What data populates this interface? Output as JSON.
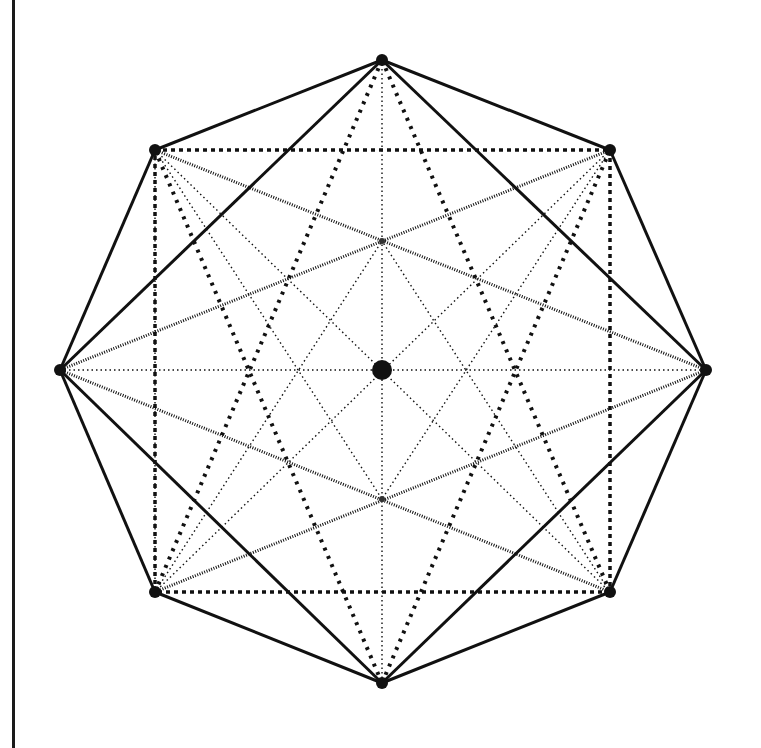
{
  "figure": {
    "colors": {
      "ink": "#111111",
      "background": "#ffffff"
    },
    "center": {
      "x": 382,
      "y": 370
    },
    "vertices": {
      "top": [
        382,
        60
      ],
      "top_right": [
        610,
        150
      ],
      "right": [
        706,
        370
      ],
      "bottom_right": [
        610,
        592
      ],
      "bottom": [
        382,
        683
      ],
      "bottom_left": [
        155,
        592
      ],
      "left": [
        60,
        370
      ],
      "top_left": [
        155,
        150
      ]
    },
    "line_styles": {
      "solid": {
        "width": 3,
        "dash": ""
      },
      "dashed_square": {
        "width": 3.5,
        "dash": "4 4"
      },
      "bold_dotted": {
        "width": 4,
        "dash": "3 6"
      },
      "hatched": {
        "width": 3,
        "dash": "1 1.5"
      },
      "fine_dotted": {
        "width": 1.4,
        "dash": "1.5 3"
      }
    },
    "segments": [
      {
        "style": "solid",
        "from": "top",
        "to": "top_right"
      },
      {
        "style": "solid",
        "from": "top_right",
        "to": "right"
      },
      {
        "style": "solid",
        "from": "right",
        "to": "bottom_right"
      },
      {
        "style": "solid",
        "from": "bottom_right",
        "to": "bottom"
      },
      {
        "style": "solid",
        "from": "bottom",
        "to": "bottom_left"
      },
      {
        "style": "solid",
        "from": "bottom_left",
        "to": "left"
      },
      {
        "style": "solid",
        "from": "left",
        "to": "top_left"
      },
      {
        "style": "solid",
        "from": "top_left",
        "to": "top"
      },
      {
        "style": "solid",
        "from": "top",
        "to": "right"
      },
      {
        "style": "solid",
        "from": "right",
        "to": "bottom"
      },
      {
        "style": "solid",
        "from": "bottom",
        "to": "left"
      },
      {
        "style": "solid",
        "from": "left",
        "to": "top"
      },
      {
        "style": "dashed_square",
        "from": "top_left",
        "to": "top_right"
      },
      {
        "style": "dashed_square",
        "from": "top_right",
        "to": "bottom_right"
      },
      {
        "style": "dashed_square",
        "from": "bottom_right",
        "to": "bottom_left"
      },
      {
        "style": "dashed_square",
        "from": "bottom_left",
        "to": "top_left"
      },
      {
        "style": "bold_dotted",
        "from": "top",
        "to": "bottom_left"
      },
      {
        "style": "bold_dotted",
        "from": "top",
        "to": "bottom_right"
      },
      {
        "style": "bold_dotted",
        "from": "bottom",
        "to": "top_left"
      },
      {
        "style": "bold_dotted",
        "from": "bottom",
        "to": "top_right"
      },
      {
        "style": "hatched",
        "from": "left",
        "to": "top_right"
      },
      {
        "style": "hatched",
        "from": "left",
        "to": "bottom_right"
      },
      {
        "style": "hatched",
        "from": "right",
        "to": "top_left"
      },
      {
        "style": "hatched",
        "from": "right",
        "to": "bottom_left"
      },
      {
        "style": "fine_dotted",
        "from": "top",
        "to": "bottom"
      },
      {
        "style": "fine_dotted",
        "from": "left",
        "to": "right"
      },
      {
        "style": "fine_dotted",
        "from": "top_left",
        "to": "bottom_right"
      },
      {
        "style": "fine_dotted",
        "from": "top_right",
        "to": "bottom_left"
      },
      {
        "style": "fine_dotted",
        "from": "top",
        "to": "left"
      },
      {
        "style": "fine_dotted",
        "from": "top_left",
        "to": "bottom_left"
      },
      {
        "style": "fine_dotted",
        "from": "top_left",
        "to": "inner_mid_bottom"
      },
      {
        "style": "fine_dotted",
        "from": "top_right",
        "to": "inner_mid_bottom"
      },
      {
        "style": "fine_dotted",
        "from": "bottom_left",
        "to": "inner_mid_top"
      },
      {
        "style": "fine_dotted",
        "from": "bottom_right",
        "to": "inner_mid_top"
      }
    ],
    "extra_points": {
      "inner_mid_top": [
        382,
        241
      ],
      "inner_mid_bottom": [
        382,
        499
      ]
    },
    "vertex_dot_radius": 6,
    "center_dot_radius": 10
  }
}
